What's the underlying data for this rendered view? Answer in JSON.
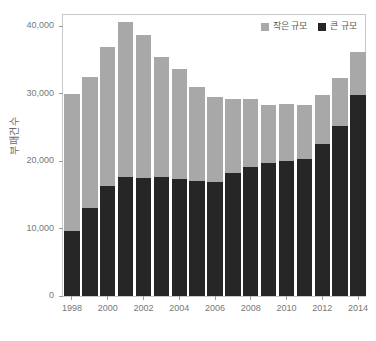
{
  "chart_data": {
    "type": "bar",
    "stacked": true,
    "title": "",
    "xlabel": "",
    "ylabel": "부패건수",
    "ylim": [
      0,
      42000
    ],
    "ytick_values": [
      0,
      10000,
      20000,
      30000,
      40000
    ],
    "ytick_labels": [
      "0",
      "10,000",
      "20,000",
      "30,000",
      "40,000"
    ],
    "grid": false,
    "legend_position": "top-right",
    "categories": [
      "1998",
      "1999",
      "2000",
      "2001",
      "2002",
      "2003",
      "2004",
      "2005",
      "2006",
      "2007",
      "2008",
      "2009",
      "2010",
      "2011",
      "2012",
      "2013",
      "2014"
    ],
    "xtick_labels": [
      "1998",
      "2000",
      "2002",
      "2004",
      "2006",
      "2008",
      "2010",
      "2012",
      "2014"
    ],
    "series": [
      {
        "name": "큰 규모",
        "color": "#262626",
        "values": [
          9600,
          13100,
          16300,
          17700,
          17500,
          17700,
          17400,
          17100,
          16900,
          18200,
          19100,
          19800,
          20000,
          20300,
          22600,
          25300,
          29800
        ]
      },
      {
        "name": "작은 규모",
        "color": "#a8a8a8",
        "values": [
          20400,
          19400,
          20700,
          22900,
          21200,
          17800,
          16300,
          13900,
          12700,
          11000,
          10100,
          8500,
          8500,
          8000,
          7200,
          7100,
          6400
        ]
      }
    ],
    "totals": [
      30000,
      32500,
      37000,
      40600,
      38700,
      35500,
      33700,
      31000,
      29600,
      29200,
      29200,
      28300,
      28500,
      28300,
      29800,
      32400,
      36200
    ]
  },
  "legend": {
    "items": [
      {
        "label": "작은 규모",
        "color": "#a8a8a8"
      },
      {
        "label": "큰 규모",
        "color": "#262626"
      }
    ]
  }
}
